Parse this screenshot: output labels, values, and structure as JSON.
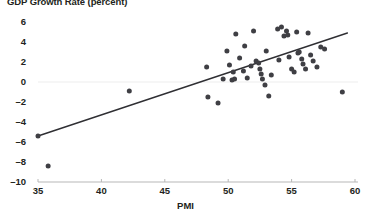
{
  "chart_data": {
    "type": "scatter",
    "title": "GDP Growth Rate (percent)",
    "xlabel": "PMI",
    "ylabel": "",
    "xlim": [
      35,
      60
    ],
    "ylim": [
      -10,
      6
    ],
    "xticks": [
      35,
      40,
      45,
      50,
      55,
      60
    ],
    "yticks": [
      6,
      4,
      2,
      0,
      -2,
      -4,
      -6,
      -8,
      -10
    ],
    "grid": "horizontal-zero-only",
    "legend": "none",
    "marker_color": "#3f3f44",
    "trendline_color": "#2f2f33",
    "axis_color": "#b7b7b7",
    "gridline_color": "#ededed",
    "trendline": {
      "type": "linear",
      "x_start": 35.0,
      "y_start": -5.4,
      "x_end": 59.4,
      "y_end": 4.9
    },
    "points": [
      {
        "x": 35.0,
        "y": -5.4
      },
      {
        "x": 35.8,
        "y": -8.4
      },
      {
        "x": 42.2,
        "y": -0.9
      },
      {
        "x": 48.3,
        "y": 1.5
      },
      {
        "x": 48.4,
        "y": -1.5
      },
      {
        "x": 49.2,
        "y": -2.1
      },
      {
        "x": 49.6,
        "y": 0.3
      },
      {
        "x": 49.9,
        "y": 3.1
      },
      {
        "x": 50.1,
        "y": 1.7
      },
      {
        "x": 50.3,
        "y": 0.2
      },
      {
        "x": 50.4,
        "y": 1.0
      },
      {
        "x": 50.5,
        "y": 0.3
      },
      {
        "x": 50.6,
        "y": 4.8
      },
      {
        "x": 50.9,
        "y": 2.4
      },
      {
        "x": 51.2,
        "y": 1.1
      },
      {
        "x": 51.3,
        "y": 3.6
      },
      {
        "x": 51.5,
        "y": 0.4
      },
      {
        "x": 51.8,
        "y": 1.6
      },
      {
        "x": 52.0,
        "y": 5.1
      },
      {
        "x": 52.2,
        "y": 2.1
      },
      {
        "x": 52.4,
        "y": 1.9
      },
      {
        "x": 52.5,
        "y": 1.3
      },
      {
        "x": 52.6,
        "y": 0.8
      },
      {
        "x": 52.7,
        "y": 0.3
      },
      {
        "x": 52.9,
        "y": -0.3
      },
      {
        "x": 53.0,
        "y": 3.1
      },
      {
        "x": 53.2,
        "y": -1.4
      },
      {
        "x": 53.4,
        "y": 0.7
      },
      {
        "x": 53.9,
        "y": 5.3
      },
      {
        "x": 54.0,
        "y": 2.2
      },
      {
        "x": 54.2,
        "y": 5.5
      },
      {
        "x": 54.4,
        "y": 4.6
      },
      {
        "x": 54.6,
        "y": 5.1
      },
      {
        "x": 54.7,
        "y": 4.7
      },
      {
        "x": 54.8,
        "y": 2.5
      },
      {
        "x": 55.0,
        "y": 1.3
      },
      {
        "x": 55.2,
        "y": 1.0
      },
      {
        "x": 55.4,
        "y": 5.0
      },
      {
        "x": 55.5,
        "y": 2.9
      },
      {
        "x": 55.6,
        "y": 3.0
      },
      {
        "x": 55.8,
        "y": 2.3
      },
      {
        "x": 55.9,
        "y": 1.8
      },
      {
        "x": 56.1,
        "y": 1.3
      },
      {
        "x": 56.3,
        "y": 4.9
      },
      {
        "x": 56.5,
        "y": 2.7
      },
      {
        "x": 56.7,
        "y": 2.1
      },
      {
        "x": 57.0,
        "y": 1.5
      },
      {
        "x": 57.3,
        "y": 3.5
      },
      {
        "x": 57.6,
        "y": 3.3
      },
      {
        "x": 59.0,
        "y": -1.0
      }
    ]
  }
}
